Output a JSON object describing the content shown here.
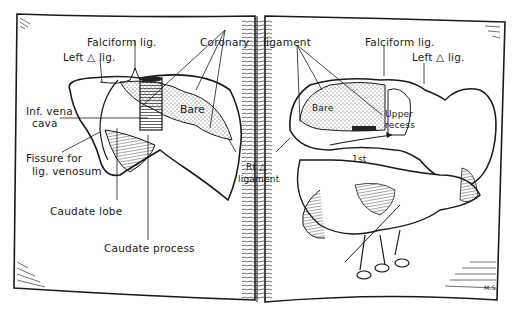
{
  "figure": {
    "type": "anatomical illustration",
    "style": "open book, two pages, pen-and-ink",
    "colors": {
      "ink": "#1a1a1a",
      "paper": "#ffffff",
      "stipple": "#555555"
    }
  },
  "left_page": {
    "title": "Liver - posterior view",
    "labels": {
      "falciform": "Falciform lig.",
      "left_triangular": "Left △ lig.",
      "coronary": "Coronary",
      "ivc_line1": "Inf. vena",
      "ivc_line2": "cava",
      "bare": "Bare",
      "fissure_line1": "Fissure for",
      "fissure_line2": "lig. venosum",
      "caudate_lobe": "Caudate lobe",
      "caudate_process": "Caudate process"
    }
  },
  "gutter": {
    "labels": {
      "rt_line1": "Rt △",
      "rt_line2": "ligament"
    }
  },
  "right_page": {
    "title": "Liver in situ with stomach and duodenum",
    "labels": {
      "coronary_cont": "ligament",
      "falciform": "Falciform lig.",
      "left_triangular": "Left △ lig.",
      "bare": "Bare",
      "upper_line1": "Upper",
      "upper_line2": "recess",
      "first": "1st"
    },
    "signature": "M.S."
  }
}
